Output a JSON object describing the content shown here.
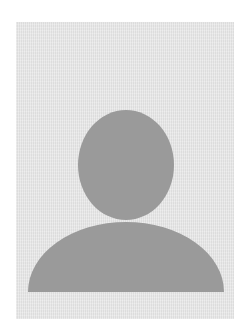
{
  "image": {
    "type": "avatar-placeholder",
    "alt": "Default user avatar silhouette",
    "icon": "user-silhouette-icon"
  },
  "colors": {
    "page_background": "#ffffff",
    "frame_background": "#e8e8e8",
    "silhouette": "#9a9a9a"
  }
}
